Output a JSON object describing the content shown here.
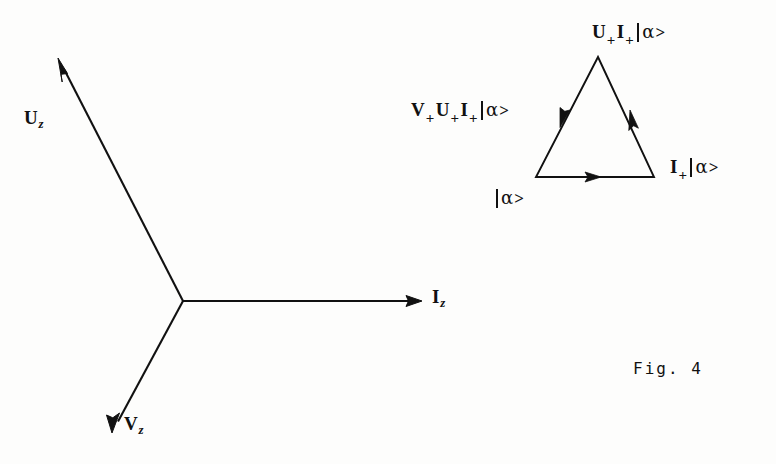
{
  "figure": {
    "caption": "Fig. 4",
    "background_color": "#fdfdfc",
    "ink_color": "#111111"
  },
  "vector_diagram": {
    "name": "three-phase-vector-star",
    "origin": {
      "x": 183,
      "y": 301
    },
    "vectors": [
      {
        "id": "Uz",
        "label_main": "U",
        "label_sub": "z",
        "tip": {
          "x": 58,
          "y": 58
        },
        "label_pos": {
          "x": 24,
          "y": 108
        },
        "angle_deg": 117
      },
      {
        "id": "Iz",
        "label_main": "I",
        "label_sub": "z",
        "tip": {
          "x": 422,
          "y": 301
        },
        "label_pos": {
          "x": 432,
          "y": 287
        },
        "angle_deg": 0
      },
      {
        "id": "Vz",
        "label_main": "V",
        "label_sub": "z",
        "tip": {
          "x": 112,
          "y": 433
        },
        "label_pos": {
          "x": 124,
          "y": 414
        },
        "angle_deg": -119
      }
    ]
  },
  "triangle_diagram": {
    "name": "operator-cycle-triangle",
    "vertices": {
      "apex": {
        "x": 598,
        "y": 57
      },
      "bottom_left": {
        "x": 536,
        "y": 177
      },
      "bottom_right": {
        "x": 654,
        "y": 177
      }
    },
    "edges": [
      {
        "id": "bottom",
        "from": "bottom_left",
        "to": "bottom_right",
        "arrow_at": {
          "x": 598,
          "y": 177
        },
        "direction": "right"
      },
      {
        "id": "right",
        "from": "bottom_right",
        "to": "apex",
        "arrow_at": {
          "x": 632,
          "y": 117
        },
        "direction": "up-left"
      },
      {
        "id": "left",
        "from": "apex",
        "to": "bottom_left",
        "arrow_at": {
          "x": 563,
          "y": 120
        },
        "direction": "down-left"
      }
    ],
    "labels": [
      {
        "id": "top",
        "text": "U+I+|α>",
        "parts": [
          {
            "type": "op",
            "text": "U"
          },
          {
            "type": "plus",
            "text": "+"
          },
          {
            "type": "op",
            "text": "I"
          },
          {
            "type": "plus",
            "text": "+"
          },
          {
            "type": "bar",
            "text": ""
          },
          {
            "type": "alpha",
            "text": "α"
          },
          {
            "type": "gt",
            "text": ">"
          }
        ],
        "pos": {
          "x": 592,
          "y": 22
        }
      },
      {
        "id": "left",
        "text": "V+U+I+|α>",
        "parts": [
          {
            "type": "op",
            "text": "V"
          },
          {
            "type": "plus",
            "text": "+"
          },
          {
            "type": "op",
            "text": "U"
          },
          {
            "type": "plus",
            "text": "+"
          },
          {
            "type": "op",
            "text": "I"
          },
          {
            "type": "plus",
            "text": "+"
          },
          {
            "type": "bar",
            "text": ""
          },
          {
            "type": "alpha",
            "text": "α"
          },
          {
            "type": "gt",
            "text": ">"
          }
        ],
        "pos": {
          "x": 411,
          "y": 100
        }
      },
      {
        "id": "right",
        "text": "I+|α>",
        "parts": [
          {
            "type": "op",
            "text": "I"
          },
          {
            "type": "plus",
            "text": "+"
          },
          {
            "type": "bar",
            "text": ""
          },
          {
            "type": "alpha",
            "text": "α"
          },
          {
            "type": "gt",
            "text": ">"
          }
        ],
        "pos": {
          "x": 670,
          "y": 157
        }
      },
      {
        "id": "bottom",
        "text": "|α>",
        "parts": [
          {
            "type": "bar",
            "text": ""
          },
          {
            "type": "alpha",
            "text": "α"
          },
          {
            "type": "gt",
            "text": ">"
          }
        ],
        "pos": {
          "x": 494,
          "y": 188
        }
      }
    ]
  }
}
